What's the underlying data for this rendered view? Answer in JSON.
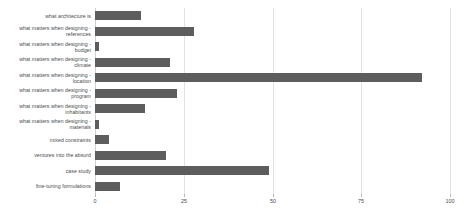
{
  "chart_data": {
    "type": "bar",
    "orientation": "horizontal",
    "title": "",
    "xlabel": "",
    "ylabel": "",
    "xlim": [
      0,
      100
    ],
    "ylim": null,
    "grid": true,
    "legend": false,
    "bar_color": "#5d5d5d",
    "grid_color": "#e2e2e2",
    "xticks": [
      "0",
      "25",
      "50",
      "75",
      "100"
    ],
    "xtick_values": [
      0,
      25,
      50,
      75,
      100
    ],
    "categories": [
      "what architecture is",
      "what matters when designing -\nreferences",
      "what matters when designing -\nbudget",
      "what matters when designing -\nclimate",
      "what matters when designing -\nlocation",
      "what matters when designing -\nprogram",
      "what matters when designing -\ninhabitants",
      "what matters when designing -\nmaterials",
      "mixed constraints",
      "ventures into the absurd",
      "case study",
      "fine-tuning formulations"
    ],
    "values": [
      13,
      28,
      1,
      21,
      92,
      23,
      14,
      1,
      4,
      20,
      49,
      7
    ]
  }
}
